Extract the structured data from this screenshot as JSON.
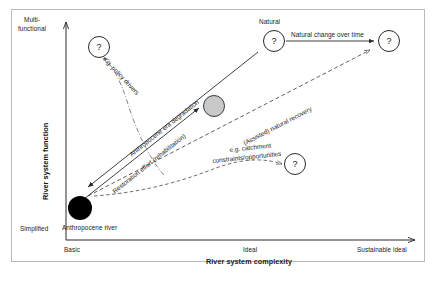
{
  "figure": {
    "type": "conceptual-trajectory-diagram",
    "axes": {
      "y": {
        "title": "River system function",
        "top_label": "Multi-\nfunctional",
        "top_label_line1": "Multi-",
        "top_label_line2": "functional",
        "bottom_label": "Simplified"
      },
      "x": {
        "title": "River system complexity",
        "ticks": [
          "Basic",
          "Ideal",
          "Sustainable ideal"
        ]
      }
    },
    "nodes": [
      {
        "id": "anthropocene-river",
        "label": "Anthropocene river",
        "style": "filled-black"
      },
      {
        "id": "degraded-state",
        "label": "",
        "style": "filled-gray"
      },
      {
        "id": "natural-state",
        "label": "Natural",
        "style": "question-circle",
        "glyph": "?"
      },
      {
        "id": "future-natural",
        "label": "",
        "style": "question-circle",
        "glyph": "?"
      },
      {
        "id": "policy-outcome",
        "label": "",
        "style": "question-circle",
        "glyph": "?"
      },
      {
        "id": "catchment-outcome",
        "label": "",
        "style": "question-circle",
        "glyph": "?"
      }
    ],
    "arrows": [
      {
        "id": "anthropocene-era-degradation",
        "label": "Anthropocene era degradation",
        "style": "solid"
      },
      {
        "id": "restoration-effort",
        "label": "Restoration effort (rehabilitation)",
        "style": "solid"
      },
      {
        "id": "natural-change-over-time",
        "label": "Natural change over time",
        "style": "solid"
      },
      {
        "id": "assisted-natural-recovery",
        "label": "(Assisted) natural recovery",
        "style": "dashed"
      },
      {
        "id": "policy-drivers",
        "label": "e.g. policy drivers",
        "style": "dash-dot"
      },
      {
        "id": "catchment-constraints",
        "label": "e.g. catchment constraints/opportunities",
        "label_line1": "e.g. catchment",
        "label_line2": "constraints/opportunities",
        "style": "dashed"
      }
    ],
    "colors": {
      "frame": "#b9b9b9",
      "axis": "#2a2a2a",
      "node_degraded": "#c9c9c9",
      "node_anthropocene": "#000000",
      "text": "#1a1a1a"
    }
  }
}
